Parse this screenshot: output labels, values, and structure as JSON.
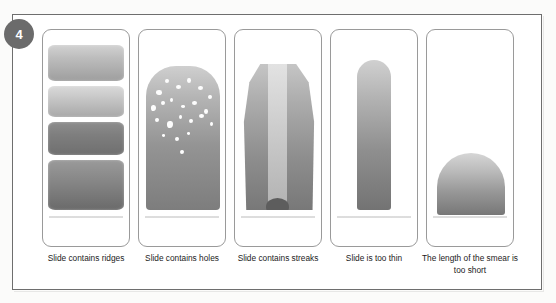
{
  "figure": {
    "number": "4",
    "badge_color": "#6b6b6b",
    "frame_border_color": "#6e6e6e"
  },
  "panels": [
    {
      "id": "panel-ridges",
      "caption": "Slide contains ridges",
      "defect": "ridges",
      "illustration": "blood smear broken into four horizontal bands with gradient shading",
      "bands": 4
    },
    {
      "id": "panel-holes",
      "caption": "Slide contains holes",
      "defect": "holes",
      "illustration": "blood smear with scattered white holes clustered in the upper feathered region",
      "hole_count": 22
    },
    {
      "id": "panel-streaks",
      "caption": "Slide contains streaks",
      "defect": "streaks",
      "illustration": "blood smear with a pale vertical streak running down the centre and a dark blob at the tail"
    },
    {
      "id": "panel-thin",
      "caption": "Slide is too thin",
      "defect": "too thin",
      "illustration": "narrow blood smear occupying only the centre of the slide"
    },
    {
      "id": "panel-short",
      "caption": "The length of the smear is too short",
      "defect": "too short",
      "illustration": "short dome-shaped blood smear that stops well before the end of the slide"
    }
  ]
}
